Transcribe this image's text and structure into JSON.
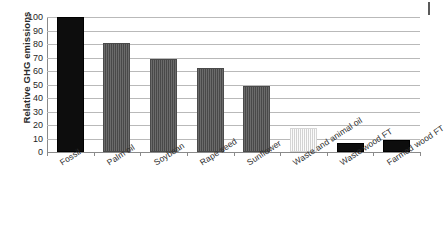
{
  "chart_data": {
    "type": "bar",
    "title": "",
    "subtitle": "",
    "xlabel": "",
    "ylabel": "Relative GHG emissions",
    "ylim": [
      0,
      100
    ],
    "ytick_step": 10,
    "yticks": [
      100,
      90,
      80,
      70,
      60,
      50,
      40,
      30,
      20,
      10,
      0
    ],
    "grid": true,
    "legend": "none",
    "categories": [
      "Fossil",
      "Palm oil",
      "Soybean",
      "Rape seed",
      "Sunflower",
      "Waste and animal oil",
      "Waste wood FT",
      "Farmed wood FT"
    ],
    "values": [
      100,
      81,
      69,
      62,
      49,
      18,
      7,
      9
    ],
    "bar_styles": [
      "black",
      "dark",
      "dark",
      "dark",
      "dark",
      "light",
      "black",
      "black"
    ],
    "colors": {
      "black_bar": "#0d0d0d",
      "dark_bar": "#4d4d4d",
      "light_bar": "#ececec",
      "gridline": "#b9b9b9",
      "axis": "#8a8a8a",
      "text": "#1f1f1f",
      "background": "#ffffff"
    }
  }
}
